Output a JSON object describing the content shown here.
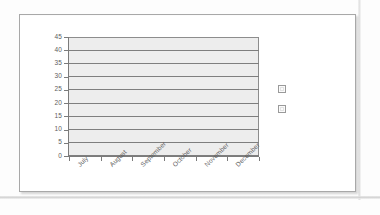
{
  "chart_data": {
    "type": "bar",
    "title": "",
    "xlabel": "",
    "ylabel": "",
    "categories": [
      "July",
      "August",
      "September",
      "October",
      "November",
      "December"
    ],
    "series": [
      {
        "name": "",
        "values": [
          null,
          null,
          null,
          null,
          null,
          null
        ]
      },
      {
        "name": "",
        "values": [
          null,
          null,
          null,
          null,
          null,
          null
        ]
      }
    ],
    "values": [
      null,
      null,
      null,
      null,
      null,
      null
    ],
    "yticks": [
      0,
      5,
      10,
      15,
      20,
      25,
      30,
      35,
      40,
      45
    ],
    "ylim": [
      0,
      45
    ],
    "grid": true,
    "legend_position": "right",
    "legend_entries": [
      "",
      ""
    ],
    "note": "no data series plotted; plot area is empty"
  },
  "axes": {
    "y": {
      "labels": [
        "45",
        "40",
        "35",
        "30",
        "25",
        "20",
        "15",
        "10",
        "5",
        "0"
      ]
    },
    "x": {
      "labels": [
        "July",
        "August",
        "September",
        "October",
        "November",
        "December"
      ]
    }
  },
  "legend": {
    "items": [
      {
        "label": "",
        "swatch_color": "#fbfbfb"
      },
      {
        "label": "",
        "swatch_color": "#fbfbfb"
      }
    ]
  },
  "colors": {
    "plot_fill": "#ededed",
    "gridline": "#7e7e7e",
    "axis_line": "#7b7b7b",
    "tick_text": "#5d5d5d",
    "card_border": "#a8a8a8",
    "page_background": "#fdfdfd",
    "card_background": "#ffffff"
  }
}
